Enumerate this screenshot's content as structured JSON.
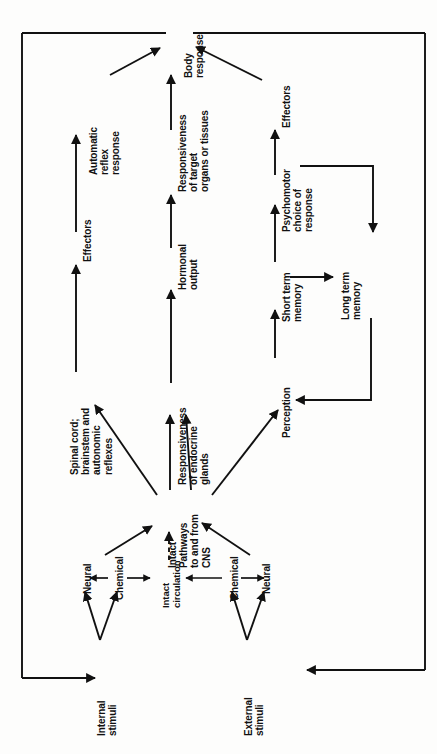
{
  "figure": {
    "type": "flowchart",
    "orientation": "rotated-90-ccw",
    "stroke_color": "#111111",
    "background_color": "#fdfdfc"
  },
  "nodes": {
    "body_response": "Body\nresponse",
    "automatic_reflex_response": "Automatic\nreflex\nresponse",
    "effectors_left": "Effectors",
    "spinal_cord": "Spinal cord;\nbrainstem and\nautonomic\nreflexes",
    "responsiveness_target": "Responsiveness\nof target\norgans or tissues",
    "hormonal_output": "Hormonal\noutput",
    "responsiveness_endocrine": "Responsiveness\nof endocrine\nglands",
    "effectors_right": "Effectors",
    "psychomotor_choice": "Psychomotor\nchoice of\nresponse",
    "short_term_memory": "Short term\nmemory",
    "long_term_memory": "Long term\nmemory",
    "perception": "Perception",
    "intact_pathways": "Intact\nPathways\nto and from\nCNS",
    "neural_left": "Neural",
    "chemical_left": "Chemical",
    "intact_circulation": "Intact\ncirculation",
    "chemical_right": "Chemical",
    "neural_right": "Neural",
    "internal_stimuli": "Internal\nstimuli",
    "external_stimuli": "External\nstimuli"
  },
  "edges": [
    {
      "from": "internal_stimuli",
      "to": "neural_left",
      "style": "solid"
    },
    {
      "from": "internal_stimuli",
      "to": "chemical_left",
      "style": "solid"
    },
    {
      "from": "external_stimuli",
      "to": "chemical_right",
      "style": "solid"
    },
    {
      "from": "external_stimuli",
      "to": "neural_right",
      "style": "solid"
    },
    {
      "from": "chemical_left",
      "to": "neural_left",
      "style": "solid"
    },
    {
      "from": "chemical_left",
      "to": "intact_circulation",
      "style": "solid"
    },
    {
      "from": "chemical_right",
      "to": "intact_circulation",
      "style": "solid"
    },
    {
      "from": "chemical_right",
      "to": "neural_right",
      "style": "solid"
    },
    {
      "from": "intact_circulation",
      "to": "intact_pathways",
      "style": "dashed"
    },
    {
      "from": "neural_left",
      "to": "intact_pathways",
      "style": "solid"
    },
    {
      "from": "neural_right",
      "to": "intact_pathways",
      "style": "solid"
    },
    {
      "from": "intact_pathways",
      "to": "spinal_cord",
      "style": "solid"
    },
    {
      "from": "intact_pathways",
      "to": "responsiveness_endocrine",
      "style": "solid"
    },
    {
      "from": "intact_pathways",
      "to": "perception",
      "style": "solid"
    },
    {
      "from": "spinal_cord",
      "to": "effectors_left",
      "style": "solid"
    },
    {
      "from": "effectors_left",
      "to": "automatic_reflex_response",
      "style": "solid"
    },
    {
      "from": "automatic_reflex_response",
      "to": "body_response",
      "style": "solid"
    },
    {
      "from": "responsiveness_endocrine",
      "to": "hormonal_output",
      "style": "solid"
    },
    {
      "from": "hormonal_output",
      "to": "responsiveness_target",
      "style": "solid"
    },
    {
      "from": "responsiveness_target",
      "to": "body_response",
      "style": "solid"
    },
    {
      "from": "perception",
      "to": "short_term_memory",
      "style": "solid"
    },
    {
      "from": "short_term_memory",
      "to": "long_term_memory",
      "style": "solid"
    },
    {
      "from": "short_term_memory",
      "to": "psychomotor_choice",
      "style": "solid"
    },
    {
      "from": "psychomotor_choice",
      "to": "long_term_memory",
      "style": "solid"
    },
    {
      "from": "long_term_memory",
      "to": "perception",
      "style": "solid"
    },
    {
      "from": "psychomotor_choice",
      "to": "effectors_right",
      "style": "solid"
    },
    {
      "from": "effectors_right",
      "to": "body_response",
      "style": "solid"
    },
    {
      "from": "body_response",
      "to": "internal_stimuli",
      "style": "solid",
      "note": "outer feedback loop left"
    },
    {
      "from": "body_response",
      "to": "external_stimuli",
      "style": "solid",
      "note": "outer feedback loop right"
    }
  ]
}
